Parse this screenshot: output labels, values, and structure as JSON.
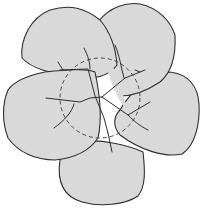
{
  "diagram": {
    "title": "",
    "colors": {
      "fill": "#d9d9d9",
      "stroke": "#2e2e2e",
      "dashed_circle": "#4a4a4a",
      "background": "#ffffff"
    },
    "petals": [
      {
        "id": "top-left",
        "label": ""
      },
      {
        "id": "top-right",
        "label": ""
      },
      {
        "id": "right",
        "label": ""
      },
      {
        "id": "bottom",
        "label": ""
      },
      {
        "id": "left",
        "label": ""
      }
    ],
    "center_circle": {
      "cx": 100,
      "cy": 98,
      "r": 40,
      "style": "dashed"
    }
  }
}
